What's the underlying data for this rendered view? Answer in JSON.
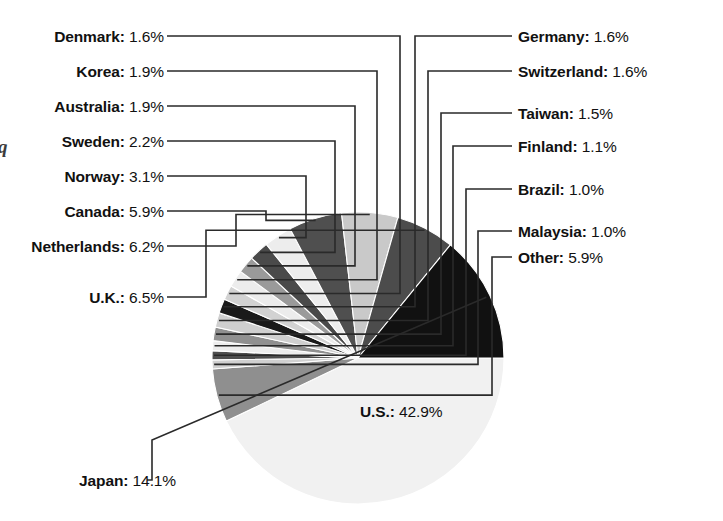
{
  "chart_data": {
    "type": "pie",
    "title": "",
    "xlabel": "",
    "ylabel": "",
    "legend_position": "callout-labels",
    "grid": false,
    "unit": "%",
    "total": 100.0,
    "start_angle_deg": 0,
    "direction": "clockwise",
    "categories": [
      "U.S.",
      "Other",
      "Malaysia",
      "Brazil",
      "Finland",
      "Taiwan",
      "Switzerland",
      "Germany",
      "Denmark",
      "Korea",
      "Australia",
      "Sweden",
      "Norway",
      "Canada",
      "Netherlands",
      "U.K.",
      "Japan"
    ],
    "values": [
      42.9,
      5.9,
      1.0,
      1.0,
      1.1,
      1.5,
      1.6,
      1.6,
      1.6,
      1.9,
      1.9,
      2.2,
      3.1,
      5.9,
      6.2,
      6.5,
      14.1
    ],
    "slice_colors": [
      "#f1f1f1",
      "#8f8f8f",
      "#d0d0d0",
      "#4e4e4e",
      "#ededed",
      "#909090",
      "#cfcfcf",
      "#1a1a1a",
      "#d2d2d2",
      "#ececec",
      "#9a9a9a",
      "#4a4a4a",
      "#ededed",
      "#4f4f4f",
      "#c9c9c9",
      "#4c4c4c",
      "#111111"
    ],
    "slices": [
      {
        "label": "U.S.",
        "value": 42.9,
        "text": "U.S.: 42.9%",
        "color": "#f1f1f1",
        "side": "inside"
      },
      {
        "label": "Other",
        "value": 5.9,
        "text": "Other: 5.9%",
        "color": "#8f8f8f",
        "side": "right"
      },
      {
        "label": "Malaysia",
        "value": 1.0,
        "text": "Malaysia: 1.0%",
        "color": "#d0d0d0",
        "side": "right"
      },
      {
        "label": "Brazil",
        "value": 1.0,
        "text": "Brazil: 1.0%",
        "color": "#4e4e4e",
        "side": "right"
      },
      {
        "label": "Finland",
        "value": 1.1,
        "text": "Finland: 1.1%",
        "color": "#ededed",
        "side": "right"
      },
      {
        "label": "Taiwan",
        "value": 1.5,
        "text": "Taiwan: 1.5%",
        "color": "#909090",
        "side": "right"
      },
      {
        "label": "Switzerland",
        "value": 1.6,
        "text": "Switzerland: 1.6%",
        "color": "#cfcfcf",
        "side": "right"
      },
      {
        "label": "Germany",
        "value": 1.6,
        "text": "Germany: 1.6%",
        "color": "#1a1a1a",
        "side": "right"
      },
      {
        "label": "Denmark",
        "value": 1.6,
        "text": "Denmark: 1.6%",
        "color": "#d2d2d2",
        "side": "left"
      },
      {
        "label": "Korea",
        "value": 1.9,
        "text": "Korea: 1.9%",
        "color": "#ececec",
        "side": "left"
      },
      {
        "label": "Australia",
        "value": 1.9,
        "text": "Australia: 1.9%",
        "color": "#9a9a9a",
        "side": "left"
      },
      {
        "label": "Sweden",
        "value": 2.2,
        "text": "Sweden: 2.2%",
        "color": "#4a4a4a",
        "side": "left"
      },
      {
        "label": "Norway",
        "value": 3.1,
        "text": "Norway: 3.1%",
        "color": "#ededed",
        "side": "left"
      },
      {
        "label": "Canada",
        "value": 5.9,
        "text": "Canada: 5.9%",
        "color": "#4f4f4f",
        "side": "left"
      },
      {
        "label": "Netherlands",
        "value": 6.2,
        "text": "Netherlands: 6.2%",
        "color": "#c9c9c9",
        "side": "left"
      },
      {
        "label": "U.K.",
        "value": 6.5,
        "text": "U.K.: 6.5%",
        "color": "#4c4c4c",
        "side": "left"
      },
      {
        "label": "Japan",
        "value": 14.1,
        "text": "Japan: 14.1%",
        "color": "#111111",
        "side": "bottom"
      }
    ]
  },
  "labels": {
    "left": [
      {
        "name": "Denmark",
        "value": "1.6%"
      },
      {
        "name": "Korea",
        "value": "1.9%"
      },
      {
        "name": "Australia",
        "value": "1.9%"
      },
      {
        "name": "Sweden",
        "value": "2.2%"
      },
      {
        "name": "Norway",
        "value": "3.1%"
      },
      {
        "name": "Canada",
        "value": "5.9%"
      },
      {
        "name": "Netherlands",
        "value": "6.2%"
      },
      {
        "name": "U.K.",
        "value": "6.5%"
      }
    ],
    "right": [
      {
        "name": "Germany",
        "value": "1.6%"
      },
      {
        "name": "Switzerland",
        "value": "1.6%"
      },
      {
        "name": "Taiwan",
        "value": "1.5%"
      },
      {
        "name": "Finland",
        "value": "1.1%"
      },
      {
        "name": "Brazil",
        "value": "1.0%"
      },
      {
        "name": "Malaysia",
        "value": "1.0%"
      },
      {
        "name": "Other",
        "value": "5.9%"
      }
    ],
    "inside": {
      "name": "U.S.",
      "value": "42.9%"
    },
    "bottom": {
      "name": "Japan",
      "value": "14.1%"
    }
  },
  "caption_fragment": "q",
  "colors": {
    "background": "#ffffff",
    "text": "#111111",
    "leader_line": "#2a2a2a"
  }
}
